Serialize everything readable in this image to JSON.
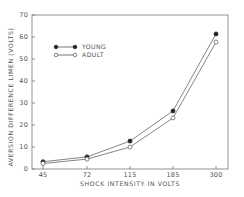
{
  "chart_data": {
    "type": "line",
    "title": "",
    "xlabel": "SHOCK INTENSITY IN VOLTS",
    "ylabel": "AVERSION DIFFERENCE LIMEN (VOLTS)",
    "categories": [
      "45",
      "72",
      "115",
      "185",
      "300"
    ],
    "ylim": [
      0,
      70
    ],
    "yticks": [
      0,
      10,
      20,
      30,
      40,
      50,
      60,
      70
    ],
    "grid": false,
    "legend_position": "upper-left",
    "series": [
      {
        "name": "YOUNG",
        "marker": "filled-circle",
        "values": [
          3.3,
          5.5,
          12.7,
          26.4,
          61.4
        ]
      },
      {
        "name": "ADULT",
        "marker": "open-circle",
        "values": [
          2.5,
          4.5,
          10.0,
          23.2,
          57.7
        ]
      }
    ]
  },
  "colors": {
    "axis": "#777777",
    "line": "#666666",
    "marker_fill": "#222222",
    "background": "#ffffff"
  }
}
